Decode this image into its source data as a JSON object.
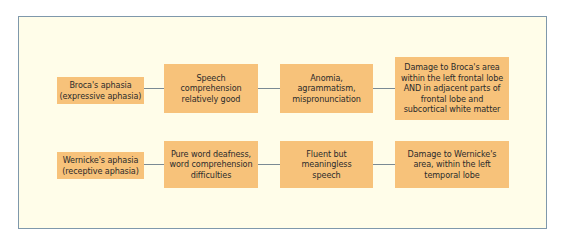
{
  "rows": [
    {
      "cells": [
        "Broca's aphasia\n(expressive aphasia)",
        "Speech\ncomprehension\nrelatively good",
        "Anomia,\nagrammatism,\nmispronunciation",
        "Damage to Broca's area\nwithin the left frontal lobe\nAND in adjacent parts of\nfrontal lobe and\nsubcortical white matter"
      ]
    },
    {
      "cells": [
        "Wernicke's aphasia\n(receptive aphasia)",
        "Pure word deafness,\nword comprehension\ndifficulties",
        "Fluent but\nmeaningless\nspeech",
        "Damage to Wernicke's\narea, within the left\ntemporal lobe"
      ]
    }
  ],
  "colors": {
    "frame_bg": "#fffde9",
    "frame_border": "#7f98ab",
    "box_fill": "#f7c27a",
    "connector": "#7a8a94"
  }
}
